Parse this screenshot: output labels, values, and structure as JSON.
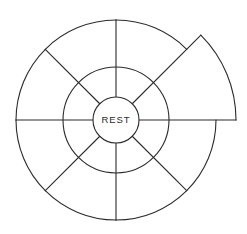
{
  "diagram": {
    "hub": {
      "label": "REST",
      "icon": "circle-hub-icon"
    },
    "geometry": {
      "center_x": 116,
      "center_y": 120,
      "hub_radius": 23,
      "inner_ring_radius": 53,
      "outer_ring_radius": 100,
      "extended_ring_radius": 120,
      "sector_count": 8,
      "sector_angle_degrees": 45,
      "start_angle_degrees": -90,
      "extended_sector_index": 1,
      "extended_sector_start_degrees": -45,
      "extended_sector_end_degrees": 0
    },
    "style": {
      "stroke_color": "#2b2b2b",
      "fill_color": "#ffffff",
      "background_color": "#ffffff",
      "stroke_width": 1.1
    },
    "sectors": [
      {
        "index": 0,
        "name": "sector-1",
        "start_deg": -90,
        "end_deg": -45,
        "extended": false
      },
      {
        "index": 1,
        "name": "sector-2",
        "start_deg": -45,
        "end_deg": 0,
        "extended": true
      },
      {
        "index": 2,
        "name": "sector-3",
        "start_deg": 0,
        "end_deg": 45,
        "extended": false
      },
      {
        "index": 3,
        "name": "sector-4",
        "start_deg": 45,
        "end_deg": 90,
        "extended": false
      },
      {
        "index": 4,
        "name": "sector-5",
        "start_deg": 90,
        "end_deg": 135,
        "extended": false
      },
      {
        "index": 5,
        "name": "sector-6",
        "start_deg": 135,
        "end_deg": 180,
        "extended": false
      },
      {
        "index": 6,
        "name": "sector-7",
        "start_deg": 180,
        "end_deg": 225,
        "extended": false
      },
      {
        "index": 7,
        "name": "sector-8",
        "start_deg": 225,
        "end_deg": 270,
        "extended": false
      }
    ]
  }
}
